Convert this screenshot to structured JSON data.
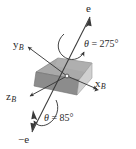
{
  "figure": {
    "kind": "3d-rotation-axis-diagram",
    "width": 136,
    "height": 149,
    "background": "#ffffff",
    "stroke_color": "#3a3a3a",
    "labels": {
      "vector_positive": "e",
      "vector_negative": "−e",
      "axis_x_base": "x",
      "axis_x_sub": "B",
      "axis_y_base": "y",
      "axis_y_sub": "B",
      "axis_z_base": "z",
      "axis_z_sub": "B",
      "angle_top_symbol": "θ",
      "angle_top_eq": " = ",
      "angle_top_value": "275°",
      "angle_bottom_symbol": "θ",
      "angle_bottom_eq": " = ",
      "angle_bottom_value": "85°"
    },
    "body": {
      "name": "parallelepiped",
      "face_top_color": "#a9a9a9",
      "face_left_color": "#8e8e8e",
      "face_right_color": "#cccccc",
      "edge_color": "#6f6f6f"
    },
    "origin": {
      "x": 67,
      "y": 76
    },
    "rotation_axis": {
      "tip_positive": {
        "x": 88,
        "y": 19
      },
      "tip_negative": {
        "x": 34,
        "y": 129
      }
    }
  }
}
